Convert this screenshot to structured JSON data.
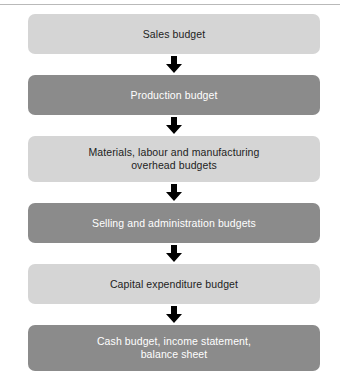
{
  "diagram": {
    "type": "flowchart-vertical",
    "colors": {
      "light_box": "#d5d5d5",
      "dark_box": "#8b8b8b",
      "light_box_text": "#1d1d1d",
      "dark_box_text": "#ffffff",
      "arrow": "#000000",
      "top_rule": "#b9b9b9",
      "background": "#ffffff"
    },
    "connector": {
      "icon": "down-arrow-icon",
      "count": 5
    },
    "nodes": [
      {
        "id": "sales-budget",
        "label": "Sales budget",
        "style": "light",
        "lines": 1
      },
      {
        "id": "production-budget",
        "label": "Production budget",
        "style": "dark",
        "lines": 1
      },
      {
        "id": "materials-labour-overhead-budgets",
        "label": "Materials, labour and manufacturing\noverhead budgets",
        "style": "light",
        "lines": 2
      },
      {
        "id": "selling-administration-budgets",
        "label": "Selling and administration budgets",
        "style": "dark",
        "lines": 1
      },
      {
        "id": "capital-expenditure-budget",
        "label": "Capital expenditure budget",
        "style": "light",
        "lines": 1
      },
      {
        "id": "cash-budget-income-statement-balance-sheet",
        "label": "Cash budget, income statement,\nbalance sheet",
        "style": "dark",
        "lines": 2
      }
    ]
  }
}
